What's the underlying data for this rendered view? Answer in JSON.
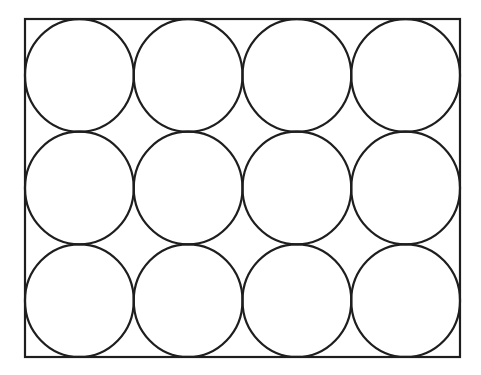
{
  "canvas": {
    "width": 481,
    "height": 375,
    "background": "#ffffff"
  },
  "stroke": {
    "color": "#1e1e1e",
    "width": 2.2
  },
  "rectangle": {
    "x": 25,
    "y": 19,
    "width": 435,
    "height": 338
  },
  "grid": {
    "rows": 3,
    "cols": 4
  },
  "shapes": {
    "type": "circle-packing",
    "description": "12 circles arranged in 3 rows x 4 columns, each tangent to its neighbours and to the enclosing rectangle",
    "count": 12,
    "rx": 54.4,
    "ry": 56.3
  }
}
